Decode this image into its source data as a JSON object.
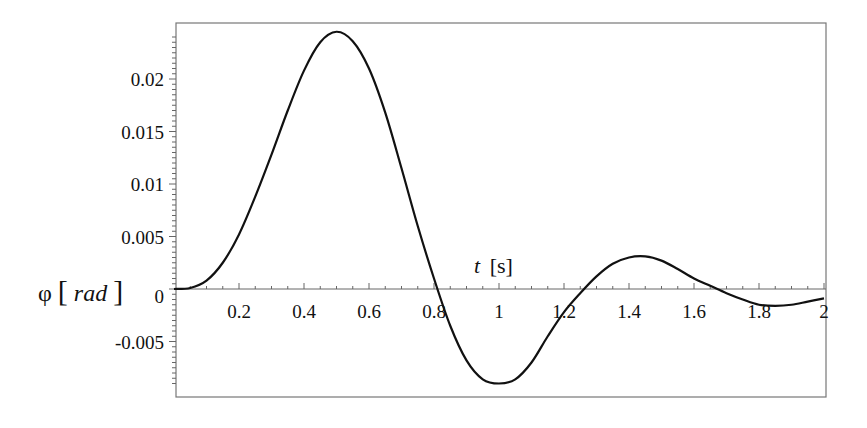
{
  "chart_data": {
    "type": "line",
    "title": "",
    "xlabel": "t [s]",
    "ylabel": "φ[rad]",
    "xlim": [
      0,
      2
    ],
    "ylim": [
      -0.0095,
      0.025
    ],
    "grid": false,
    "legend": null,
    "x_ticks": [
      0.2,
      0.4,
      0.6,
      0.8,
      1.0,
      1.2,
      1.4,
      1.6,
      1.8,
      2.0
    ],
    "x_tick_labels": [
      "0.2",
      "0.4",
      "0.6",
      "0.8",
      "1",
      "1.2",
      "1.4",
      "1.6",
      "1.8",
      "2"
    ],
    "y_ticks": [
      -0.005,
      0,
      0.005,
      0.01,
      0.015,
      0.02
    ],
    "y_tick_labels": [
      "-0.005",
      "0",
      "0.005",
      "0.01",
      "0.015",
      "0.02"
    ],
    "series": [
      {
        "name": "φ(t)",
        "color": "#111111",
        "x": [
          0,
          0.05,
          0.1,
          0.15,
          0.2,
          0.25,
          0.3,
          0.35,
          0.4,
          0.45,
          0.5,
          0.55,
          0.6,
          0.65,
          0.7,
          0.75,
          0.8,
          0.85,
          0.9,
          0.95,
          1.0,
          1.05,
          1.1,
          1.15,
          1.2,
          1.25,
          1.3,
          1.35,
          1.4,
          1.45,
          1.5,
          1.55,
          1.6,
          1.65,
          1.7,
          1.75,
          1.8,
          1.85,
          1.9,
          1.95,
          2.0
        ],
        "values": [
          0,
          0.0001,
          0.0008,
          0.0025,
          0.0052,
          0.0088,
          0.0128,
          0.017,
          0.0208,
          0.0235,
          0.0245,
          0.0236,
          0.021,
          0.0168,
          0.0115,
          0.006,
          0.001,
          -0.0035,
          -0.0068,
          -0.0086,
          -0.009,
          -0.0086,
          -0.007,
          -0.0045,
          -0.0022,
          -0.0004,
          0.0012,
          0.0024,
          0.003,
          0.0031,
          0.0027,
          0.0019,
          0.001,
          0.0003,
          -0.0004,
          -0.001,
          -0.0015,
          -0.0016,
          -0.0015,
          -0.0012,
          -0.0009
        ]
      }
    ]
  },
  "labels": {
    "x_axis_var": "t",
    "x_axis_unit": "[s]",
    "y_axis_var": "φ",
    "y_axis_unit": "rad"
  }
}
